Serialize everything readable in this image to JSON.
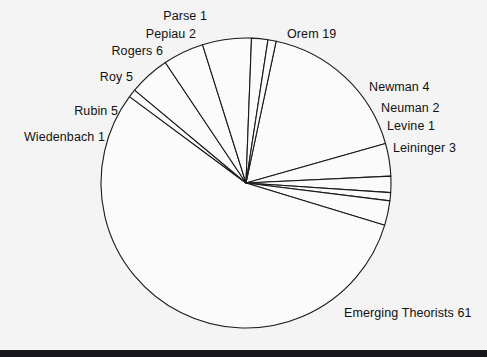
{
  "page": {
    "background_color": "#f4f4f4",
    "bottom_bar_color": "#17171a"
  },
  "chart_data": {
    "type": "pie",
    "title": "",
    "subtitle": "",
    "xlabel": "",
    "ylabel": "",
    "grid": false,
    "legend_position": "none",
    "label_format": "{name} {value}",
    "style": {
      "fill": "#fbfbfb",
      "stroke": "#1a1a1a",
      "stroke_width": 1.1,
      "start_angle_deg": 78,
      "direction": "clockwise",
      "center_x": 246,
      "center_y": 183,
      "radius": 145
    },
    "total": 110,
    "categories": [
      "Orem",
      "Newman",
      "Neuman",
      "Levine",
      "Leininger",
      "Emerging Theorists",
      "Wiedenbach",
      "Rubin",
      "Roy",
      "Rogers",
      "Pepiau",
      "Parse"
    ],
    "values": [
      19,
      4,
      2,
      1,
      3,
      61,
      1,
      5,
      5,
      6,
      2,
      1
    ],
    "slices": [
      {
        "name": "Orem",
        "value": 19,
        "label": "Orem 19",
        "label_x": 287,
        "label_y": 27,
        "align": "left"
      },
      {
        "name": "Newman",
        "value": 4,
        "label": "Newman 4",
        "label_x": 369,
        "label_y": 80,
        "align": "left"
      },
      {
        "name": "Neuman",
        "value": 2,
        "label": "Neuman 2",
        "label_x": 381,
        "label_y": 101,
        "align": "left"
      },
      {
        "name": "Levine",
        "value": 1,
        "label": "Levine 1",
        "label_x": 387,
        "label_y": 119,
        "align": "left"
      },
      {
        "name": "Leininger",
        "value": 3,
        "label": "Leininger 3",
        "label_x": 393,
        "label_y": 141,
        "align": "left"
      },
      {
        "name": "Emerging Theorists",
        "value": 61,
        "label": "Emerging Theorists 61",
        "label_x": 344,
        "label_y": 306,
        "align": "left"
      },
      {
        "name": "Wiedenbach",
        "value": 1,
        "label": "Wiedenbach 1",
        "label_x": 105,
        "label_y": 130,
        "align": "right"
      },
      {
        "name": "Rubin",
        "value": 5,
        "label": "Rubin 5",
        "label_x": 118,
        "label_y": 104,
        "align": "right"
      },
      {
        "name": "Roy",
        "value": 5,
        "label": "Roy 5",
        "label_x": 133,
        "label_y": 70,
        "align": "right"
      },
      {
        "name": "Rogers",
        "value": 6,
        "label": "Rogers 6",
        "label_x": 163,
        "label_y": 44,
        "align": "right"
      },
      {
        "name": "Pepiau",
        "value": 2,
        "label": "Pepiau 2",
        "label_x": 196,
        "label_y": 27,
        "align": "right"
      },
      {
        "name": "Parse",
        "value": 1,
        "label": "Parse 1",
        "label_x": 207,
        "label_y": 9,
        "align": "right"
      }
    ]
  }
}
